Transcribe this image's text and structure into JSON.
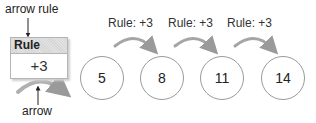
{
  "callouts": {
    "top": "arrow rule",
    "bottom": "arrow"
  },
  "rule_box": {
    "header": "Rule",
    "value": "+3"
  },
  "sequence": {
    "terms": [
      "5",
      "8",
      "11",
      "14"
    ],
    "rule_labels": [
      "Rule: +3",
      "Rule: +3",
      "Rule: +3"
    ]
  },
  "colors": {
    "arrow": "#9a9a9a",
    "circle_border": "#9a9a9a",
    "rule_header_bg": "#dcdcdc"
  }
}
